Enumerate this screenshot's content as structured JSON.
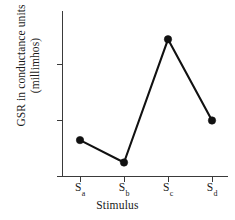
{
  "chart_data": {
    "type": "line",
    "title": "",
    "xlabel": "Stimulus",
    "ylabel": "GSR in conductance units (millimhos)",
    "ylabel_line1": "GSR in conductance units",
    "ylabel_line2": "(millimhos)",
    "categories": [
      "Sa",
      "Sb",
      "Sc",
      "Sd"
    ],
    "category_labels": [
      {
        "base": "S",
        "sub": "a"
      },
      {
        "base": "S",
        "sub": "b"
      },
      {
        "base": "S",
        "sub": "c"
      },
      {
        "base": "S",
        "sub": "d"
      }
    ],
    "values": [
      0.65,
      0.25,
      2.45,
      1.0
    ],
    "ylim": [
      0,
      2.9
    ],
    "yticks": [
      0,
      1,
      2
    ],
    "ytick_labels": [
      "0",
      "1",
      "2"
    ],
    "grid": false,
    "legend": false,
    "marker": "filled-circle",
    "line_color": "#111111",
    "marker_color": "#111111",
    "axis_color": "#3a3a3a",
    "background_color": "#ffffff"
  }
}
